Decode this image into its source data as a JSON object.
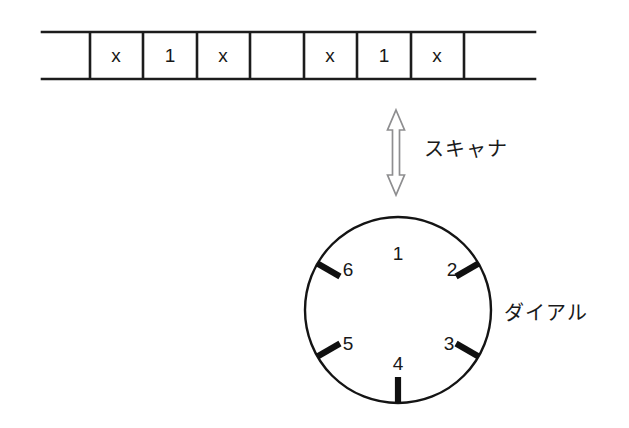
{
  "figure": {
    "title": "",
    "colors": {
      "ink": "#1c1c1c",
      "arrow_outline": "#8e8e90",
      "background": "#ffffff"
    }
  },
  "tape": {
    "name": "tape",
    "cells": [
      {
        "index": 1,
        "value": ""
      },
      {
        "index": 2,
        "value": "x"
      },
      {
        "index": 3,
        "value": "1"
      },
      {
        "index": 4,
        "value": "x"
      },
      {
        "index": 5,
        "value": ""
      },
      {
        "index": 6,
        "value": "x"
      },
      {
        "index": 7,
        "value": "1"
      },
      {
        "index": 8,
        "value": "x"
      },
      {
        "index": 9,
        "value": ""
      }
    ]
  },
  "scanner": {
    "label": "スキャナ",
    "arrow_icon": "double-headed-vertical-arrow"
  },
  "dial": {
    "label": "ダイアル",
    "positions": [
      {
        "number": "1",
        "angle_deg": 0
      },
      {
        "number": "2",
        "angle_deg": 60
      },
      {
        "number": "3",
        "angle_deg": 120
      },
      {
        "number": "4",
        "angle_deg": 180
      },
      {
        "number": "5",
        "angle_deg": 240
      },
      {
        "number": "6",
        "angle_deg": 300
      }
    ]
  }
}
